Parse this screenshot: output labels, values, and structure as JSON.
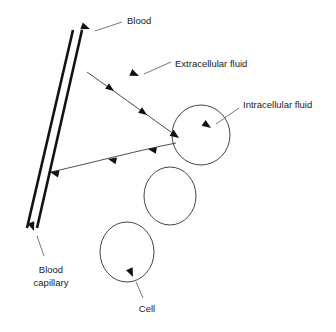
{
  "diagram": {
    "canvas": {
      "width": 336,
      "height": 332,
      "background": "#ffffff"
    },
    "colors": {
      "vessel_wall": "#121212",
      "cell_outline": "#444444",
      "flow_line": "#3a3a3a",
      "leader_line": "#555555",
      "text": "#1a1a1a"
    },
    "labels": {
      "blood": "Blood",
      "extracellular_fluid": "Extracellular fluid",
      "intracellular_fluid": "Intracellular fluid",
      "blood_capillary_line1": "Blood",
      "blood_capillary_line2": "capillary",
      "cell": "Cell"
    },
    "structures": {
      "capillary": {
        "name": "blood-capillary",
        "wall_left": {
          "x1": 73,
          "y1": 30,
          "x2": 27,
          "y2": 228
        },
        "wall_right": {
          "x1": 82,
          "y1": 30,
          "x2": 37,
          "y2": 228
        }
      },
      "cells": [
        {
          "name": "cell-upper",
          "cx": 201,
          "cy": 135,
          "rx": 29,
          "ry": 30
        },
        {
          "name": "cell-middle",
          "cx": 170,
          "cy": 196,
          "rx": 26,
          "ry": 29
        },
        {
          "name": "cell-lower",
          "cx": 127,
          "cy": 252,
          "rx": 27,
          "ry": 30
        }
      ]
    },
    "flows": [
      {
        "name": "flow-capillary-to-cell",
        "direction": "capillary-to-cell",
        "from": {
          "x": 87,
          "y": 72
        },
        "to": {
          "x": 178,
          "y": 137
        }
      },
      {
        "name": "flow-cell-to-capillary",
        "direction": "cell-to-capillary",
        "from": {
          "x": 176,
          "y": 143
        },
        "to": {
          "x": 51,
          "y": 172
        }
      }
    ],
    "annotations": [
      {
        "name": "blood",
        "text_x": 127,
        "text_y": 21,
        "tip_x": 91,
        "tip_y": 29
      },
      {
        "name": "extracellular-fluid",
        "text_x": 175,
        "text_y": 64,
        "tip_x": 139,
        "tip_y": 76
      },
      {
        "name": "intracellular-fluid",
        "text_x": 243,
        "text_y": 105,
        "tip_x": 211,
        "tip_y": 127
      },
      {
        "name": "blood-capillary",
        "text_x": 51,
        "text_y": 270,
        "tip_x": 34,
        "tip_y": 231
      },
      {
        "name": "cell",
        "text_x": 147,
        "text_y": 309,
        "tip_x": 133,
        "tip_y": 277
      }
    ]
  }
}
